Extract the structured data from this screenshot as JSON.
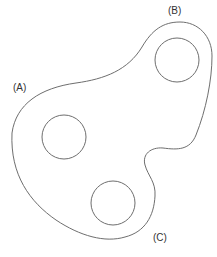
{
  "diagram": {
    "labels": {
      "a": "(A)",
      "b": "(B)",
      "c": "(C)"
    },
    "stroke_color": "#6e6e6e",
    "holes": [
      {
        "id": "upper-right",
        "cx": 177,
        "cy": 60,
        "r": 22
      },
      {
        "id": "middle-left",
        "cx": 64,
        "cy": 137,
        "r": 22
      },
      {
        "id": "bottom",
        "cx": 113,
        "cy": 203,
        "r": 22
      }
    ]
  }
}
